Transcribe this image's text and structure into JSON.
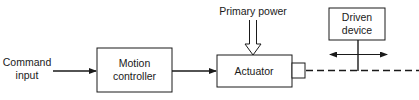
{
  "diagram": {
    "colors": {
      "stroke": "#1a1a1a",
      "background": "#ffffff"
    },
    "input": {
      "line1": "Command",
      "line2": "input"
    },
    "blocks": {
      "motion_controller": {
        "line1": "Motion",
        "line2": "controller"
      },
      "actuator": {
        "label": "Actuator"
      },
      "driven_device": {
        "line1": "Driven",
        "line2": "device"
      }
    },
    "power": {
      "label": "Primary power"
    }
  }
}
